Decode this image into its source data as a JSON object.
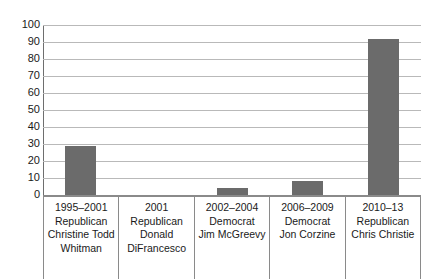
{
  "chart_data": {
    "type": "bar",
    "title": "",
    "xlabel": "",
    "ylabel": "",
    "ylim": [
      0,
      100
    ],
    "ytick_step": 10,
    "grid": true,
    "legend": "none",
    "bar_color": "#6b6b6b",
    "gridline_color": "#b9b9b9",
    "axis_color": "#8a8a8a",
    "categories": [
      "1995–2001 Republican Christine Todd Whitman",
      "2001 Republican Donald DiFrancesco",
      "2002–2004 Democrat Jim McGreevy",
      "2006–2009 Democrat Jon Corzine",
      "2010–13 Republican Chris Christie"
    ],
    "values": [
      29,
      0,
      4,
      8,
      92
    ],
    "ytick_labels": [
      "100",
      "90",
      "80",
      "70",
      "60",
      "50",
      "40",
      "30",
      "20",
      "10",
      "0"
    ]
  },
  "table": {
    "cells": [
      {
        "years": "1995–2001",
        "party": "Republican",
        "name_line1": "Christine Todd",
        "name_line2": "Whitman"
      },
      {
        "years": "2001",
        "party": "Republican",
        "name_line1": "Donald",
        "name_line2": "DiFrancesco"
      },
      {
        "years": "2002–2004",
        "party": "Democrat",
        "name_line1": "Jim McGreevy",
        "name_line2": ""
      },
      {
        "years": "2006–2009",
        "party": "Democrat",
        "name_line1": "Jon Corzine",
        "name_line2": ""
      },
      {
        "years": "2010–13",
        "party": "Republican",
        "name_line1": "Chris Christie",
        "name_line2": ""
      }
    ]
  }
}
